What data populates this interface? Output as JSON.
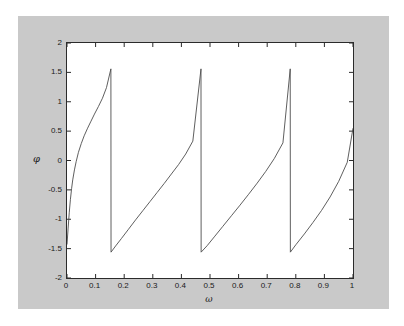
{
  "figure": {
    "background_color": "#c9c9c9",
    "axes_background_color": "#ffffff",
    "axes_border_color": "#2b2b2b",
    "line_color": "#4d4d4d"
  },
  "chart_data": {
    "type": "line",
    "title": "",
    "xlabel": "ω",
    "ylabel": "φ",
    "xlim": [
      0,
      1
    ],
    "ylim": [
      -2,
      2
    ],
    "grid": false,
    "legend": null,
    "xticks": [
      0,
      0.1,
      0.2,
      0.3,
      0.4,
      0.5,
      0.6,
      0.7,
      0.8,
      0.9,
      1
    ],
    "xtick_labels": [
      "0",
      "0.1",
      "0.2",
      "0.3",
      "0.4",
      "0.5",
      "0.6",
      "0.7",
      "0.8",
      "0.9",
      "1"
    ],
    "yticks": [
      -2,
      -1.5,
      -1,
      -0.5,
      0,
      0.5,
      1,
      1.5,
      2
    ],
    "ytick_labels": [
      "-2",
      "-1.5",
      "-1",
      "-0.5",
      "0",
      "0.5",
      "1",
      "1.5",
      "2"
    ],
    "wrap_points": [
      0.154,
      0.469,
      0.781
    ],
    "series": [
      {
        "name": "phase",
        "x": [
          0.0,
          0.004,
          0.008,
          0.012,
          0.016,
          0.02,
          0.026,
          0.032,
          0.04,
          0.05,
          0.06,
          0.072,
          0.084,
          0.096,
          0.11,
          0.124,
          0.138,
          0.1535,
          0.154,
          0.17,
          0.19,
          0.215,
          0.24,
          0.265,
          0.29,
          0.315,
          0.34,
          0.365,
          0.39,
          0.415,
          0.44,
          0.4685,
          0.469,
          0.49,
          0.515,
          0.545,
          0.575,
          0.605,
          0.635,
          0.665,
          0.695,
          0.725,
          0.755,
          0.7805,
          0.781,
          0.8,
          0.83,
          0.86,
          0.89,
          0.92,
          0.95,
          0.98,
          1.0
        ],
        "y": [
          -1.43,
          -1.15,
          -0.88,
          -0.66,
          -0.48,
          -0.33,
          -0.16,
          -0.02,
          0.14,
          0.29,
          0.42,
          0.55,
          0.67,
          0.79,
          0.92,
          1.06,
          1.24,
          1.56,
          -1.56,
          -1.455,
          -1.33,
          -1.17,
          -1.01,
          -0.855,
          -0.7,
          -0.545,
          -0.39,
          -0.23,
          -0.07,
          0.11,
          0.33,
          1.56,
          -1.56,
          -1.45,
          -1.3,
          -1.12,
          -0.94,
          -0.76,
          -0.575,
          -0.385,
          -0.185,
          0.035,
          0.3,
          1.56,
          -1.56,
          -1.435,
          -1.25,
          -1.055,
          -0.85,
          -0.62,
          -0.355,
          -0.03,
          0.55
        ]
      }
    ]
  }
}
